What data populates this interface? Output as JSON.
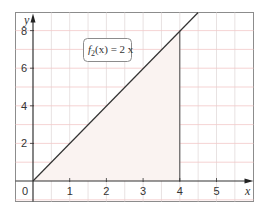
{
  "chart_data": {
    "type": "area",
    "title": "",
    "xlabel": "x",
    "ylabel": "y",
    "xlim": [
      0,
      6
    ],
    "ylim": [
      0,
      9
    ],
    "x_ticks": [
      1,
      2,
      3,
      4,
      5
    ],
    "y_ticks": [
      2,
      4,
      6,
      8
    ],
    "origin_label": "0",
    "grid": true,
    "series": [
      {
        "name": "f2(x) = 2x",
        "type": "line",
        "x": [
          0,
          4.5
        ],
        "y": [
          0,
          9
        ]
      }
    ],
    "shaded_region": {
      "description": "area under f2 from x=0 to x=4",
      "x_from": 0,
      "x_to": 4,
      "vertices": [
        [
          0,
          0
        ],
        [
          4,
          0
        ],
        [
          4,
          8
        ]
      ]
    },
    "vertical_line": {
      "x": 4,
      "y_from": 0,
      "y_to": 8
    },
    "annotation": {
      "text_prefix": "f",
      "text_sub": "2",
      "text_suffix": "(x) = 2 x",
      "x": 1.5,
      "y": 7
    }
  },
  "colors": {
    "frame": "#8c8c8c",
    "grid_vertical": "#e2dada",
    "grid_horizontal": "#f2c8c8",
    "axis": "#333333",
    "curve": "#333333",
    "fill": "#faf3f1"
  }
}
